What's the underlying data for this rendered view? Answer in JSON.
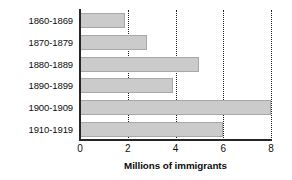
{
  "chart_data": {
    "type": "bar",
    "orientation": "horizontal",
    "title": "",
    "xlabel": "Millions of immigrants",
    "ylabel": "",
    "categories": [
      "1860-1869",
      "1870-1879",
      "1880-1889",
      "1890-1899",
      "1900-1909",
      "1910-1919"
    ],
    "values": [
      1.9,
      2.8,
      5.0,
      3.9,
      8.0,
      6.0
    ],
    "xlim": [
      0,
      8
    ],
    "xticks": [
      0,
      2,
      4,
      6,
      8
    ],
    "xtick_labels": [
      "0",
      "2",
      "4",
      "6",
      "8"
    ],
    "gridlines": [
      2,
      4,
      6,
      8
    ],
    "grid": true,
    "grid_style": "dotted",
    "legend": null,
    "bar_color": "#cbcbcb",
    "bar_border_color": "#a8a8a8",
    "axis_color": "#262626",
    "grid_color": "#1a1a1a",
    "background": "#ffffff"
  }
}
